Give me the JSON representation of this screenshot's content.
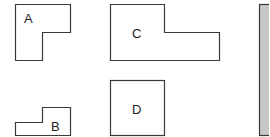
{
  "diagram": {
    "shapes": [
      {
        "id": "A",
        "label": "A",
        "kind": "L-shape"
      },
      {
        "id": "B",
        "label": "B",
        "kind": "step-shape"
      },
      {
        "id": "C",
        "label": "C",
        "kind": "L-shape"
      },
      {
        "id": "D",
        "label": "D",
        "kind": "square"
      }
    ],
    "bar": {
      "kind": "shaded-rectangle",
      "fill": "#c8c8c8"
    },
    "colors": {
      "stroke": "#3a3a3a",
      "background": "#ffffff",
      "bar_fill": "#c8c8c8"
    }
  }
}
